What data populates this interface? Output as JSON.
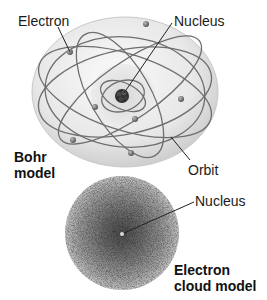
{
  "diagram": {
    "bohr_model": {
      "title_line1": "Bohr",
      "title_line2": "model",
      "labels": {
        "electron": "Electron",
        "nucleus": "Nucleus",
        "orbit": "Orbit"
      }
    },
    "cloud_model": {
      "title_line1": "Electron",
      "title_line2": "cloud model",
      "labels": {
        "nucleus": "Nucleus"
      }
    },
    "colors": {
      "sphere": "#e6e6e6",
      "orbit": "#6a6a6a",
      "nucleus": "#3a3a3a",
      "cloud_core": "#555555",
      "cloud_edge": "#bdbdbd"
    }
  }
}
